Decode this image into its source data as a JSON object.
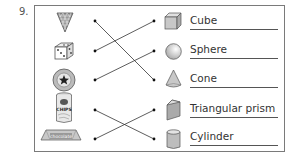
{
  "question": {
    "number": "9."
  },
  "left_items": [
    {
      "name": "ice-cream-cone",
      "icon": "waffle-cone-icon"
    },
    {
      "name": "dice",
      "icon": "dice-icon"
    },
    {
      "name": "ball",
      "icon": "star-ball-icon"
    },
    {
      "name": "chips-can",
      "icon": "chips-can-icon",
      "text": "CHIPS"
    },
    {
      "name": "chocolate-bar",
      "icon": "chocolate-bar-icon",
      "text": "chocolate"
    }
  ],
  "right_items": [
    {
      "label": "Cube",
      "icon": "cube-icon"
    },
    {
      "label": "Sphere",
      "icon": "sphere-icon"
    },
    {
      "label": "Cone",
      "icon": "cone-icon"
    },
    {
      "label": "Triangular prism",
      "icon": "triangular-prism-icon"
    },
    {
      "label": "Cylinder",
      "icon": "cylinder-icon"
    }
  ],
  "connections": [
    {
      "from": "ice-cream-cone",
      "to": "Cone"
    },
    {
      "from": "dice",
      "to": "Cube"
    },
    {
      "from": "ball",
      "to": "Sphere"
    },
    {
      "from": "chips-can",
      "to": "Cylinder"
    },
    {
      "from": "chocolate-bar",
      "to": "Triangular prism"
    }
  ],
  "colors": {
    "border": "#7a7a7a",
    "shape_fill": "#c8c8c8",
    "line": "#333333"
  }
}
